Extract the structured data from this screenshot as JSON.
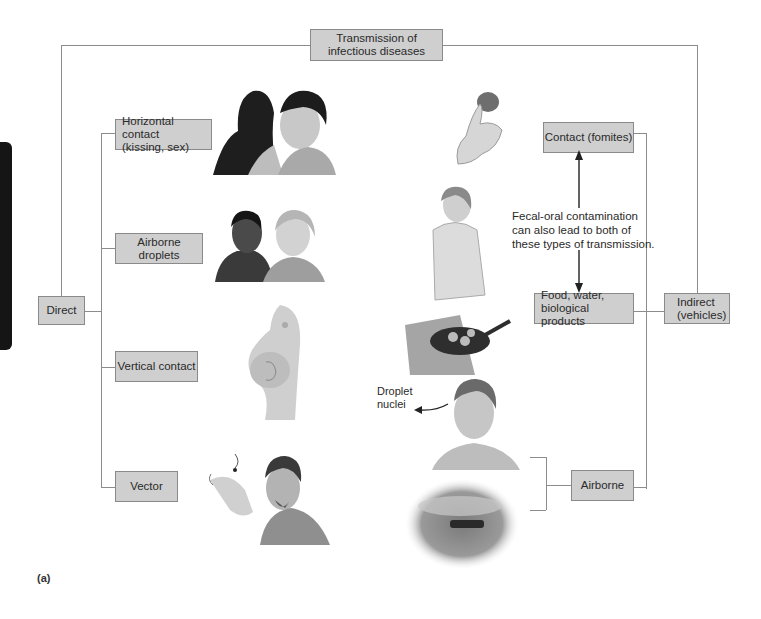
{
  "title": {
    "line1": "Transmission of",
    "line2": "infectious diseases"
  },
  "direct": {
    "label": "Direct",
    "items": [
      {
        "label_line1": "Horizontal contact",
        "label_line2": "(kissing, sex)",
        "illustration": "kissing-couple"
      },
      {
        "label": "Airborne droplets",
        "illustration": "two-people-talking"
      },
      {
        "label": "Vertical contact",
        "illustration": "pregnant-woman"
      },
      {
        "label": "Vector",
        "illustration": "man-with-mosquito"
      }
    ]
  },
  "indirect": {
    "label_line1": "Indirect",
    "label_line2": "(vehicles)",
    "items": [
      {
        "label": "Contact (fomites)",
        "illustration": "hand-with-object"
      },
      {
        "label_line1": "Food, water,",
        "label_line2": "biological products",
        "illustration": "woman-cooking"
      },
      {
        "label": "Airborne",
        "illustration": "man-coughing-and-dust-cloud"
      }
    ]
  },
  "note": {
    "line1": "Fecal-oral contamination",
    "line2": "can also lead to both of",
    "line3": "these types of transmission."
  },
  "droplet_label": {
    "line1": "Droplet",
    "line2": "nuclei"
  },
  "caption": "(a)",
  "colors": {
    "box_fill": "#cfcfcf",
    "box_border": "#8a8a8a",
    "line": "#8c8c8c",
    "tab": "#151515"
  }
}
